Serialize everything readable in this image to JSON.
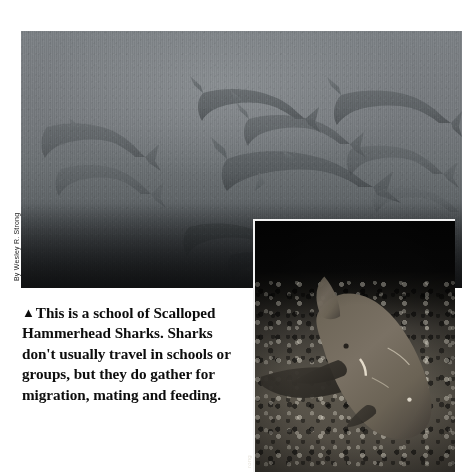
{
  "page": {
    "background_color": "#ffffff",
    "width": 472,
    "height": 472
  },
  "main_photo": {
    "name": "school-of-scalloped-hammerhead-sharks",
    "alt": "Underwater wide shot of a school of scalloped hammerhead sharks in grey-green open water above a dark sea floor",
    "dominant_color": "#6d7174",
    "credit": "By Wesley R. Strong"
  },
  "inset_photo": {
    "name": "nurse-shark-on-reef-floor",
    "alt": "Night photograph of a large nurse shark resting on a rubble and coral sea floor",
    "dominant_color": "#4f4b43",
    "credit": "rong"
  },
  "caption": {
    "marker": "▲",
    "text": "This is a school of Scalloped Hammerhead Sharks. Sharks don't usually travel in schools or groups, but they do gather for migration, mating and feeding.",
    "lines": [
      "This is a school of",
      "Scalloped Hammerhead",
      "Sharks. Sharks don't usually",
      "travel in schools or groups,",
      "but they do gather for",
      "migration, mating and",
      "feeding."
    ],
    "text_color": "#0d0d0d"
  }
}
